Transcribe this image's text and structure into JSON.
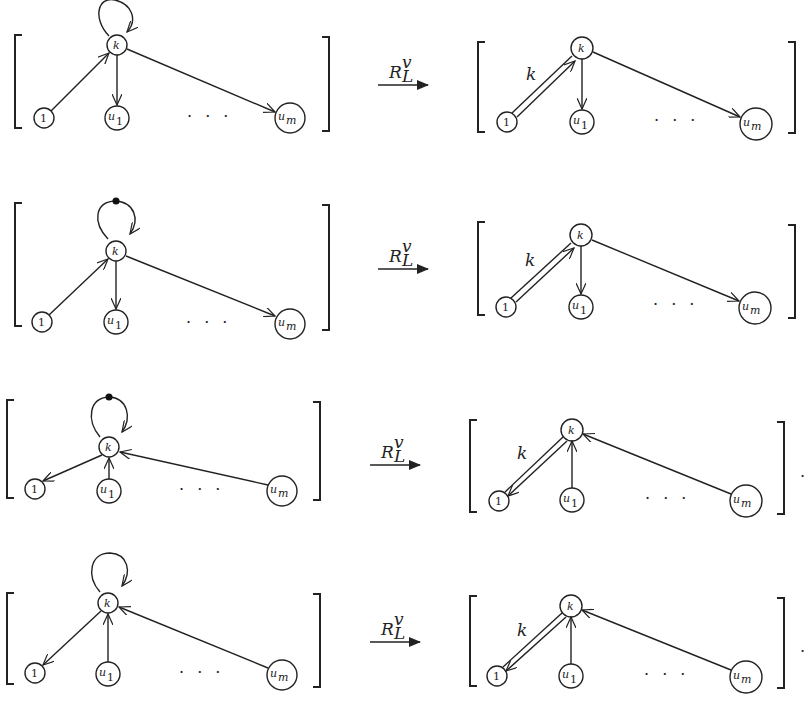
{
  "operator": {
    "symbol": "R",
    "subscript": "L",
    "superscript": "v"
  },
  "node_labels": {
    "center": "k",
    "one": "1",
    "u1_base": "u",
    "u1_sub": "1",
    "um_base": "u",
    "um_sub": "m"
  },
  "edge_label": "k",
  "ellipsis": "· · ·",
  "terminal_period": ".",
  "rows": [
    {
      "id": "row-1",
      "loop": "plain",
      "direction": "outward",
      "result_double_edge": "1-to-k",
      "trailing_period": false
    },
    {
      "id": "row-2",
      "loop": "dotted",
      "direction": "outward",
      "result_double_edge": "1-to-k",
      "trailing_period": false
    },
    {
      "id": "row-3",
      "loop": "dotted",
      "direction": "inward",
      "result_double_edge": "k-to-1",
      "trailing_period": true
    },
    {
      "id": "row-4",
      "loop": "plain",
      "direction": "inward",
      "result_double_edge": "k-to-1",
      "trailing_period": true
    }
  ],
  "colors": {
    "ink": "#222222",
    "background": "#ffffff"
  }
}
